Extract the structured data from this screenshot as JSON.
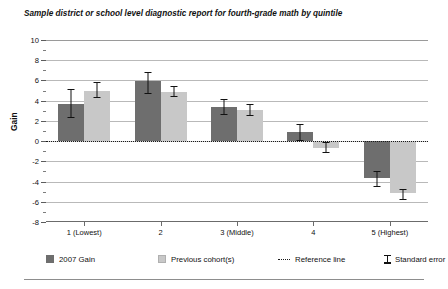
{
  "chart_data": {
    "type": "bar",
    "title": "Sample district or school level diagnostic report for fourth-grade math by quintile",
    "xlabel": "",
    "ylabel": "Gain",
    "ylim": [
      -8,
      10
    ],
    "ytick_labels": [
      "10",
      "8",
      "6",
      "4",
      "2",
      "0",
      "-2",
      "-4",
      "-6",
      "-8"
    ],
    "ytick_values": [
      10,
      8,
      6,
      4,
      2,
      0,
      -2,
      -4,
      -6,
      -8
    ],
    "minor_tick_values": [
      9,
      7,
      5,
      3,
      1,
      -1,
      -3,
      -5,
      -7
    ],
    "grid": true,
    "legend_position": "bottom",
    "reference_line_value": 0,
    "categories": [
      "1 (Lowest)",
      "2",
      "3 (Middle)",
      "4",
      "5 (Highest)"
    ],
    "series": [
      {
        "name": "2007 Gain",
        "color": "#6e6e6e",
        "values": [
          3.7,
          5.9,
          3.4,
          0.9,
          -3.6
        ],
        "errors_low": [
          2.3,
          4.7,
          2.6,
          0.0,
          -4.5
        ],
        "errors_high": [
          5.2,
          6.8,
          4.2,
          1.7,
          -3.0
        ]
      },
      {
        "name": "Previous cohort(s)",
        "color": "#c8c8c8",
        "values": [
          5.0,
          4.9,
          3.1,
          -0.7,
          -5.1
        ],
        "errors_low": [
          4.3,
          4.4,
          2.5,
          -1.2,
          -5.8
        ],
        "errors_high": [
          5.8,
          5.5,
          3.7,
          -0.1,
          -4.7
        ]
      }
    ],
    "legend": [
      {
        "label": "2007 Gain",
        "kind": "swatch-dark"
      },
      {
        "label": "Previous cohort(s)",
        "kind": "swatch-light"
      },
      {
        "label": "Reference line",
        "kind": "dotted-line"
      },
      {
        "label": "Standard error",
        "kind": "error-glyph"
      }
    ]
  }
}
